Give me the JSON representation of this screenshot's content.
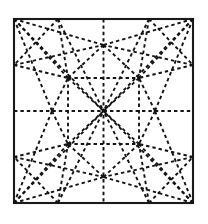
{
  "figure": {
    "sheet": {
      "x": 14,
      "y": 19,
      "width": 179,
      "height": 184,
      "border_color": "#1a1a1a",
      "fill_color": "#ffffff",
      "border_width": 2.1
    },
    "crease_style": {
      "color": "#141414",
      "width": 1.9,
      "dash": "3.4 3.0",
      "line_type": "dashed"
    },
    "geometry": {
      "corners": {
        "top_left": [
          14,
          19
        ],
        "top_right": [
          193,
          19
        ],
        "bottom_right": [
          193,
          203
        ],
        "bottom_left": [
          14,
          203
        ]
      },
      "center": [
        103.5,
        111
      ],
      "edge_midpoints": {
        "top": [
          103.5,
          19
        ],
        "bottom": [
          103.5,
          203
        ],
        "left": [
          14,
          111
        ],
        "right": [
          193,
          111
        ]
      },
      "hubs": {
        "upper_left": [
          68,
          78
        ],
        "upper_right": [
          139,
          78
        ],
        "lower_left": [
          68,
          144
        ],
        "lower_right": [
          139,
          144
        ]
      },
      "midline_nodes": {
        "left": [
          52,
          111
        ],
        "right": [
          155,
          111
        ],
        "top": [
          103.5,
          45
        ],
        "bottom": [
          103.5,
          177
        ]
      },
      "edge_anchors": {
        "top_left_quarter": [
          58,
          19
        ],
        "top_right_quarter": [
          149,
          19
        ],
        "bottom_left_quarter": [
          58,
          203
        ],
        "bottom_right_quarter": [
          149,
          203
        ],
        "left_upper_quarter": [
          14,
          65
        ],
        "left_lower_quarter": [
          14,
          157
        ],
        "right_upper_quarter": [
          193,
          65
        ],
        "right_lower_quarter": [
          193,
          157
        ]
      }
    },
    "creases": [
      {
        "name": "vertical-midline",
        "x1": 103.5,
        "y1": 19,
        "x2": 103.5,
        "y2": 203
      },
      {
        "name": "horizontal-midline",
        "x1": 14,
        "y1": 111,
        "x2": 193,
        "y2": 111
      },
      {
        "name": "diag-tl-center",
        "x1": 14,
        "y1": 19,
        "x2": 103.5,
        "y2": 111
      },
      {
        "name": "diag-tr-center",
        "x1": 193,
        "y1": 19,
        "x2": 103.5,
        "y2": 111
      },
      {
        "name": "diag-bl-center",
        "x1": 14,
        "y1": 203,
        "x2": 103.5,
        "y2": 111
      },
      {
        "name": "diag-br-center",
        "x1": 193,
        "y1": 203,
        "x2": 103.5,
        "y2": 111
      },
      {
        "name": "tl-hub-ul",
        "x1": 14,
        "y1": 19,
        "x2": 68,
        "y2": 78
      },
      {
        "name": "tr-hub-ur",
        "x1": 193,
        "y1": 19,
        "x2": 139,
        "y2": 78
      },
      {
        "name": "bl-hub-ll",
        "x1": 14,
        "y1": 203,
        "x2": 68,
        "y2": 144
      },
      {
        "name": "br-hub-lr",
        "x1": 193,
        "y1": 203,
        "x2": 139,
        "y2": 144
      },
      {
        "name": "tl-to-topnode",
        "x1": 14,
        "y1": 19,
        "x2": 103.5,
        "y2": 45
      },
      {
        "name": "tr-to-topnode",
        "x1": 193,
        "y1": 19,
        "x2": 103.5,
        "y2": 45
      },
      {
        "name": "bl-to-botnode",
        "x1": 14,
        "y1": 203,
        "x2": 103.5,
        "y2": 177
      },
      {
        "name": "br-to-botnode",
        "x1": 193,
        "y1": 203,
        "x2": 103.5,
        "y2": 177
      },
      {
        "name": "tl-to-leftnode",
        "x1": 14,
        "y1": 19,
        "x2": 52,
        "y2": 111
      },
      {
        "name": "bl-to-leftnode",
        "x1": 14,
        "y1": 203,
        "x2": 52,
        "y2": 111
      },
      {
        "name": "tr-to-rightnode",
        "x1": 193,
        "y1": 19,
        "x2": 155,
        "y2": 111
      },
      {
        "name": "br-to-rightnode",
        "x1": 193,
        "y1": 203,
        "x2": 155,
        "y2": 111
      },
      {
        "name": "topedge-to-hub-ul",
        "x1": 58,
        "y1": 19,
        "x2": 68,
        "y2": 78
      },
      {
        "name": "topedge-to-hub-ur",
        "x1": 149,
        "y1": 19,
        "x2": 139,
        "y2": 78
      },
      {
        "name": "botedge-to-hub-ll",
        "x1": 58,
        "y1": 203,
        "x2": 68,
        "y2": 144
      },
      {
        "name": "botedge-to-hub-lr",
        "x1": 149,
        "y1": 203,
        "x2": 139,
        "y2": 144
      },
      {
        "name": "topnode-to-hub-ul",
        "x1": 103.5,
        "y1": 45,
        "x2": 68,
        "y2": 78
      },
      {
        "name": "topnode-to-hub-ur",
        "x1": 103.5,
        "y1": 45,
        "x2": 139,
        "y2": 78
      },
      {
        "name": "botnode-to-hub-ll",
        "x1": 103.5,
        "y1": 177,
        "x2": 68,
        "y2": 144
      },
      {
        "name": "botnode-to-hub-lr",
        "x1": 103.5,
        "y1": 177,
        "x2": 139,
        "y2": 144
      },
      {
        "name": "leftnode-to-hub-ul",
        "x1": 52,
        "y1": 111,
        "x2": 68,
        "y2": 78
      },
      {
        "name": "leftnode-to-hub-ll",
        "x1": 52,
        "y1": 111,
        "x2": 68,
        "y2": 144
      },
      {
        "name": "rightnode-to-hub-ur",
        "x1": 155,
        "y1": 111,
        "x2": 139,
        "y2": 78
      },
      {
        "name": "rightnode-to-hub-lr",
        "x1": 155,
        "y1": 111,
        "x2": 139,
        "y2": 144
      },
      {
        "name": "leftedge-up-to-hub-ul",
        "x1": 14,
        "y1": 65,
        "x2": 68,
        "y2": 78
      },
      {
        "name": "leftedge-low-to-hub-ll",
        "x1": 14,
        "y1": 157,
        "x2": 68,
        "y2": 144
      },
      {
        "name": "rightedge-up-to-hub-ur",
        "x1": 193,
        "y1": 65,
        "x2": 139,
        "y2": 78
      },
      {
        "name": "rightedge-low-to-hub-lr",
        "x1": 193,
        "y1": 157,
        "x2": 139,
        "y2": 144
      },
      {
        "name": "hub-ul-to-center",
        "x1": 68,
        "y1": 78,
        "x2": 103.5,
        "y2": 111
      },
      {
        "name": "hub-ur-to-center",
        "x1": 139,
        "y1": 78,
        "x2": 103.5,
        "y2": 111
      },
      {
        "name": "hub-ll-to-center",
        "x1": 68,
        "y1": 144,
        "x2": 103.5,
        "y2": 111
      },
      {
        "name": "hub-lr-to-center",
        "x1": 139,
        "y1": 144,
        "x2": 103.5,
        "y2": 111
      },
      {
        "name": "topedge-center-left-fan",
        "x1": 58,
        "y1": 19,
        "x2": 103.5,
        "y2": 111
      },
      {
        "name": "topedge-center-right-fan",
        "x1": 149,
        "y1": 19,
        "x2": 103.5,
        "y2": 111
      },
      {
        "name": "botedge-center-left-fan",
        "x1": 58,
        "y1": 203,
        "x2": 103.5,
        "y2": 111
      },
      {
        "name": "botedge-center-right-fan",
        "x1": 149,
        "y1": 203,
        "x2": 103.5,
        "y2": 111
      },
      {
        "name": "leftedge-up-to-topnode",
        "x1": 14,
        "y1": 65,
        "x2": 103.5,
        "y2": 45
      },
      {
        "name": "rightedge-up-to-topnode",
        "x1": 193,
        "y1": 65,
        "x2": 103.5,
        "y2": 45
      },
      {
        "name": "leftedge-low-to-botnode",
        "x1": 14,
        "y1": 157,
        "x2": 103.5,
        "y2": 177
      },
      {
        "name": "rightedge-low-to-botnode",
        "x1": 193,
        "y1": 157,
        "x2": 103.5,
        "y2": 177
      },
      {
        "name": "hub-ul-to-hub-ur",
        "x1": 68,
        "y1": 78,
        "x2": 139,
        "y2": 78
      },
      {
        "name": "hub-ll-to-hub-lr",
        "x1": 68,
        "y1": 144,
        "x2": 139,
        "y2": 144
      },
      {
        "name": "hub-ul-to-hub-ll",
        "x1": 68,
        "y1": 78,
        "x2": 68,
        "y2": 144
      },
      {
        "name": "hub-ur-to-hub-lr",
        "x1": 139,
        "y1": 78,
        "x2": 139,
        "y2": 144
      },
      {
        "name": "topedge-left-to-leftedge-up",
        "x1": 58,
        "y1": 19,
        "x2": 14,
        "y2": 65
      },
      {
        "name": "topedge-right-to-rightedge-up",
        "x1": 149,
        "y1": 19,
        "x2": 193,
        "y2": 65
      },
      {
        "name": "botedge-left-to-leftedge-low",
        "x1": 58,
        "y1": 203,
        "x2": 14,
        "y2": 157
      },
      {
        "name": "botedge-right-to-rightedge-low",
        "x1": 149,
        "y1": 203,
        "x2": 193,
        "y2": 157
      }
    ]
  }
}
